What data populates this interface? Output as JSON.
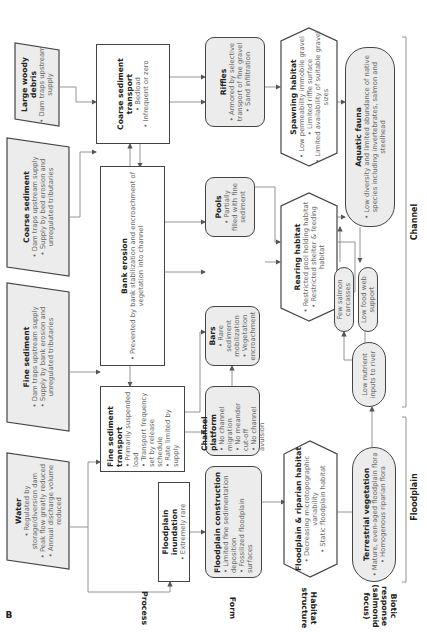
{
  "panel_letter": "B",
  "row_labels": {
    "process": "Process",
    "form": "Form",
    "habitat": "Habitat structure",
    "biotic": "Biotic response (salmonid focus)"
  },
  "bracket_labels": {
    "floodplain": "Floodplain",
    "channel": "Channel"
  },
  "drivers": [
    {
      "id": "water",
      "title": "Water",
      "bullets": [
        "Regulated by storage/diversion dam",
        "Peak flow greatly reduced",
        "Annual discharge volume reduced"
      ]
    },
    {
      "id": "fine_sediment",
      "title": "Fine sediment",
      "bullets": [
        "Dam traps upstream supply",
        "Supply by bank erosion and unregulated tributaries"
      ]
    },
    {
      "id": "coarse_sediment",
      "title": "Coarse sediment",
      "bullets": [
        "Dam traps upstream supply",
        "Supply by bed erosion and unregulated tributaries"
      ]
    },
    {
      "id": "large_woody_debris",
      "title": "Large woody debris",
      "bullets": [
        "Dam traps upstream supply"
      ]
    }
  ],
  "process": [
    {
      "id": "floodplain_inundation",
      "title": "Floodplain inundation",
      "bullets": [
        "Extremely rare"
      ]
    },
    {
      "id": "fine_sediment_transport",
      "title": "Fine sediment transport",
      "bullets": [
        "Primarily suspended load",
        "Transport frequency set by release schedule",
        "Rate limited by supply"
      ]
    },
    {
      "id": "bank_erosion",
      "title": "Bank erosion",
      "bullets": [
        "Prevented by bank stabilization and encroachment of vegetation into channel"
      ]
    },
    {
      "id": "coarse_sediment_transport",
      "title": "Coarse sediment transport",
      "bullets": [
        "Bedload",
        "Infrequent or zero"
      ]
    }
  ],
  "form": [
    {
      "id": "floodplain_construction",
      "title": "Floodplain construction",
      "bullets": [
        "Limited fine sedimentation deposition",
        "Fossilized floodplain surfaces"
      ]
    },
    {
      "id": "channel_platform",
      "title": "Channel platform",
      "bullets": [
        "No channel migration",
        "No meander cut-off",
        "No channel avulsion"
      ]
    },
    {
      "id": "bars",
      "title": "Bars",
      "bullets": [
        "Rare sediment mobilization",
        "Vegetation encroachment"
      ]
    },
    {
      "id": "pools",
      "title": "Pools",
      "bullets": [
        "Partially filled with fine sediment"
      ]
    },
    {
      "id": "riffles",
      "title": "Riffles",
      "bullets": [
        "Armored by selective transport of fine gravel",
        "Sand infiltration"
      ]
    }
  ],
  "habitat": [
    {
      "id": "floodplain_riparian_habitat",
      "title": "Floodplain & riparian habitat",
      "bullets": [
        "Decreasing microtopographic variability",
        "Static floodplain habitat"
      ]
    },
    {
      "id": "rearing_habitat",
      "title": "Rearing habitat",
      "bullets": [
        "Restricted pool holding habitat",
        "Restricted shelter & feeding habitat"
      ]
    },
    {
      "id": "spawning_habitat",
      "title": "Spawning habitat",
      "bullets": [
        "Low permeability immobile gravel",
        "Limited riffle surface",
        "Limited availability of suitable gravel sizes"
      ]
    }
  ],
  "biotic": [
    {
      "id": "terrestrial_vegetation",
      "title": "Terrestrial vegetation",
      "bullets": [
        "Mature, even-aged floodplain flora",
        "Homogenous riparian flora"
      ]
    },
    {
      "id": "low_nutrient_inputs",
      "title": "",
      "text": "Low nutrient inputs to river"
    },
    {
      "id": "few_salmon_carcasses",
      "title": "",
      "text": "Few salmon carcasses"
    },
    {
      "id": "low_food_web_support",
      "title": "",
      "text": "Low food web support"
    },
    {
      "id": "aquatic_fauna",
      "title": "Aquatic fauna",
      "bullets": [
        "Low diversity and limited abundance of native species including invertebrates, salmon and steelhead"
      ]
    }
  ],
  "colors": {
    "box_fill_grey": "#ececec",
    "box_fill_white": "#ffffff",
    "stroke": "#444444",
    "connector": "#777777"
  }
}
